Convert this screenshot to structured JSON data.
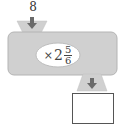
{
  "machine": {
    "input_value": "8",
    "operation": {
      "operator": "×",
      "whole": "2",
      "numerator": "5",
      "denominator": "6"
    },
    "output_value": ""
  },
  "colors": {
    "machine_fill": "#d0d0d0",
    "machine_edge": "#b4b4b4",
    "arrow": "#6a6a6a",
    "oval_fill": "#ffffff",
    "output_border": "#555555"
  }
}
